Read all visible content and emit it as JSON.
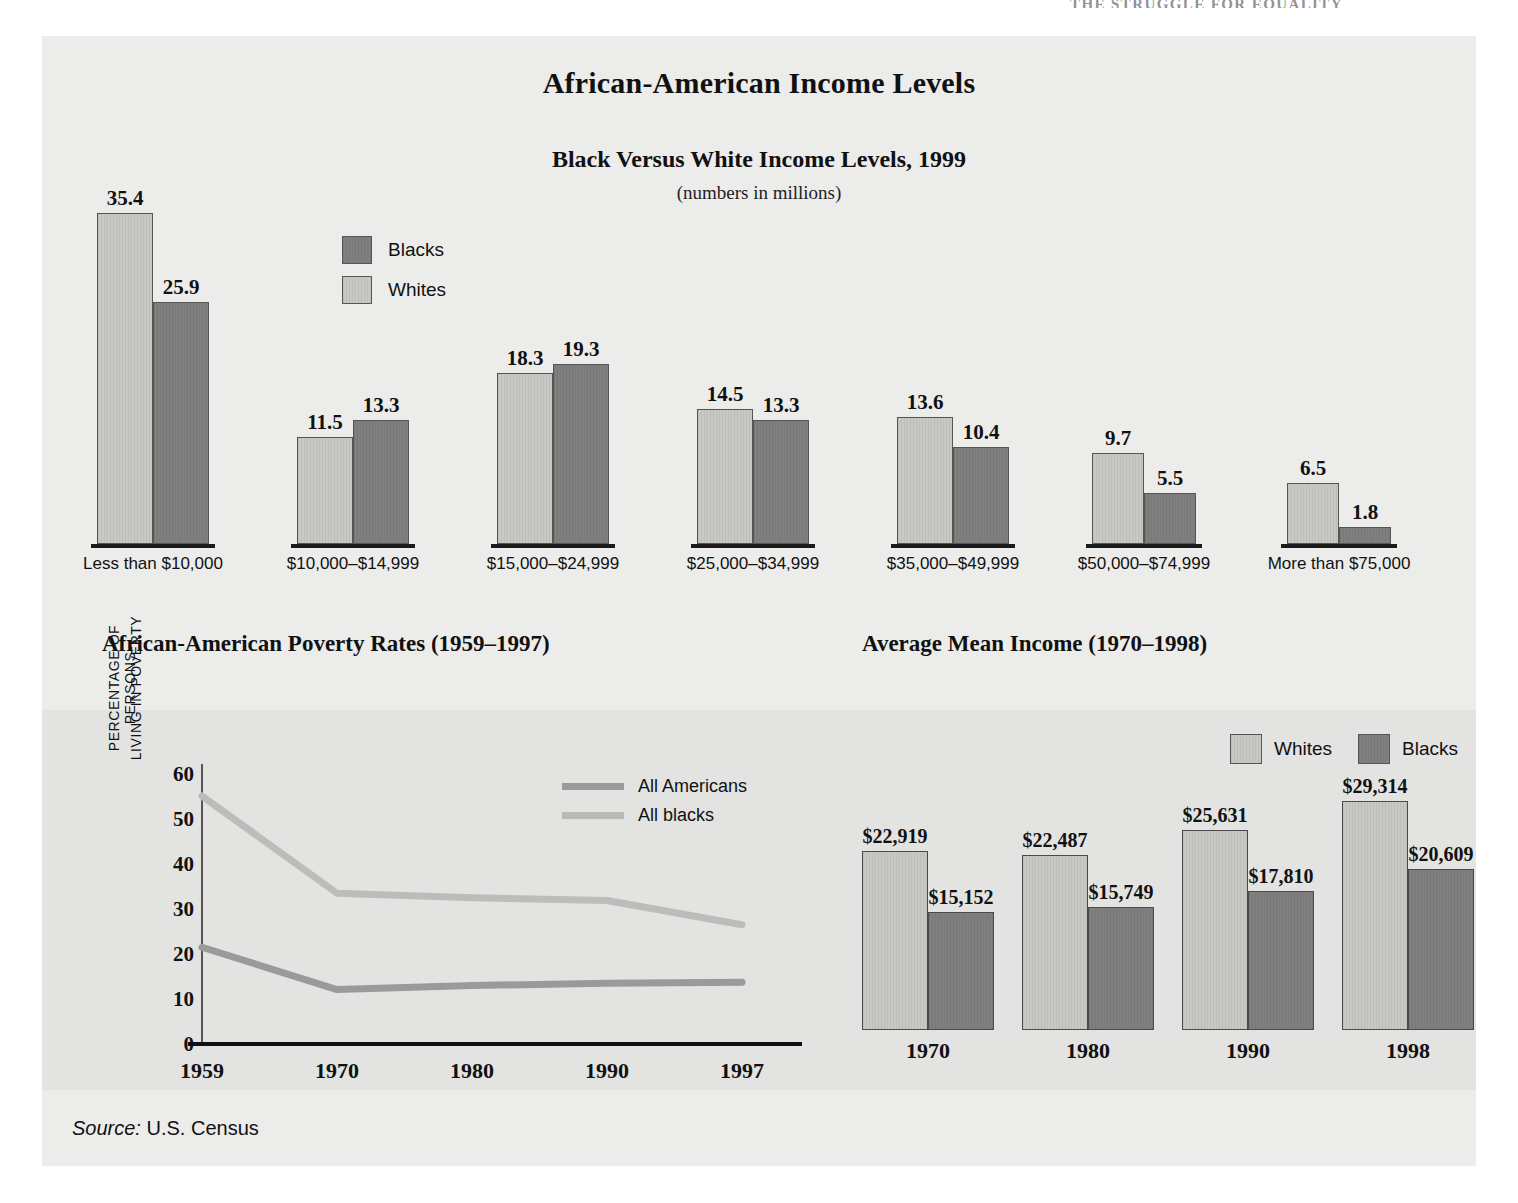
{
  "running_head": "THE STRUGGLE FOR EQUALITY",
  "titles": {
    "main": "African-American Income Levels",
    "sub": "Black Versus White Income Levels, 1999",
    "note": "(numbers in millions)",
    "poverty": "African-American Poverty Rates (1959–1997)",
    "income": "Average Mean Income (1970–1998)"
  },
  "source": {
    "prefix": "Source:",
    "text": "U.S. Census"
  },
  "colors": {
    "light": "#c8c8c4",
    "dark": "#7f7f7f",
    "panel": "#ececeb",
    "band": "#e3e3e2"
  },
  "legends": {
    "top": [
      {
        "label": "Blacks",
        "tone": "dark"
      },
      {
        "label": "Whites",
        "tone": "light"
      }
    ],
    "line": [
      {
        "label": "All Americans",
        "tone": "dark"
      },
      {
        "label": "All blacks",
        "tone": "light"
      }
    ],
    "income": [
      {
        "label": "Whites",
        "tone": "light"
      },
      {
        "label": "Blacks",
        "tone": "dark"
      }
    ]
  },
  "chart_data": [
    {
      "type": "bar",
      "title": "Black Versus White Income Levels, 1999",
      "subtitle": "(numbers in millions)",
      "xlabel": "",
      "ylabel": "numbers in millions",
      "categories": [
        "Less than $10,000",
        "$10,000–$14,999",
        "$15,000–$24,999",
        "$25,000–$34,999",
        "$35,000–$49,999",
        "$50,000–$74,999",
        "More than $75,000"
      ],
      "series": [
        {
          "name": "Whites",
          "values": [
            35.4,
            11.5,
            18.3,
            14.5,
            13.6,
            9.7,
            6.5
          ]
        },
        {
          "name": "Blacks",
          "values": [
            25.9,
            13.3,
            19.3,
            13.3,
            10.4,
            5.5,
            1.8
          ]
        }
      ],
      "value_labels": [
        [
          "35.4",
          "25.9"
        ],
        [
          "11.5",
          "13.3"
        ],
        [
          "18.3",
          "19.3"
        ],
        [
          "14.5",
          "13.3"
        ],
        [
          "13.6",
          "10.4"
        ],
        [
          "9.7",
          "5.5"
        ],
        [
          "6.5",
          "1.8"
        ]
      ],
      "ylim": [
        0,
        36
      ],
      "grid": false,
      "legend_position": "inside-top-left"
    },
    {
      "type": "line",
      "title": "African-American Poverty Rates (1959–1997)",
      "xlabel": "",
      "ylabel": "PERCENTAGE OF PERSONS LIVING IN POVERTY",
      "x": [
        "1959",
        "1970",
        "1980",
        "1990",
        "1997"
      ],
      "xticks": [
        "1959",
        "1970",
        "1980",
        "1990",
        "1997"
      ],
      "yticks": [
        "0",
        "10",
        "20",
        "30",
        "40",
        "50",
        "60"
      ],
      "ylim": [
        0,
        60
      ],
      "series": [
        {
          "name": "All Americans",
          "values": [
            21.5,
            12.1,
            13.0,
            13.5,
            13.7
          ]
        },
        {
          "name": "All blacks",
          "values": [
            55.1,
            33.5,
            32.5,
            31.9,
            26.5
          ]
        }
      ],
      "grid": false,
      "legend_position": "top-right"
    },
    {
      "type": "bar",
      "title": "Average Mean Income (1970–1998)",
      "xlabel": "",
      "ylabel": "",
      "categories": [
        "1970",
        "1980",
        "1990",
        "1998"
      ],
      "series": [
        {
          "name": "Whites",
          "values": [
            22919,
            22487,
            25631,
            29314
          ]
        },
        {
          "name": "Blacks",
          "values": [
            15152,
            15749,
            17810,
            20609
          ]
        }
      ],
      "value_labels": [
        [
          "$22,919",
          "$15,152"
        ],
        [
          "$22,487",
          "$15,749"
        ],
        [
          "$25,631",
          "$17,810"
        ],
        [
          "$29,314",
          "$20,609"
        ]
      ],
      "ylim": [
        0,
        30000
      ],
      "grid": false,
      "legend_position": "top-right"
    }
  ]
}
